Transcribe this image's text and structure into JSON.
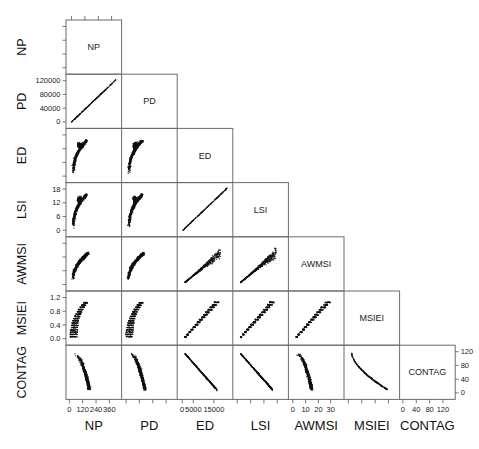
{
  "figure": {
    "type": "scatterplot-matrix",
    "variables": [
      "NP",
      "PD",
      "ED",
      "LSI",
      "AWMSI",
      "MSIEI",
      "CONTAG"
    ],
    "layout": "lower-triangular pairwise scatterplot matrix with variable names on the diagonal",
    "panel_count": 28,
    "background": "#ffffff",
    "point_color": "#111111",
    "frame_color": "#6b6b6b"
  },
  "row_labels": [
    "NP",
    "PD",
    "ED",
    "LSI",
    "AWMSI",
    "MSIEI",
    "CONTAG"
  ],
  "column_labels": [
    "NP",
    "PD",
    "ED",
    "LSI",
    "AWMSI",
    "MSIEI",
    "CONTAG"
  ],
  "diagonal_labels": [
    "NP",
    "PD",
    "ED",
    "LSI",
    "AWMSI",
    "MSIEI",
    "CONTAG"
  ],
  "axes": {
    "left": [
      {
        "var": "PD",
        "ticks": [
          "120000",
          "80000",
          "40000",
          "0"
        ],
        "values": [
          120000,
          80000,
          40000,
          0
        ]
      },
      {
        "var": "LSI",
        "ticks": [
          "18",
          "12",
          "6",
          "0"
        ],
        "values": [
          18,
          12,
          6,
          0
        ]
      },
      {
        "var": "MSIEI",
        "ticks": [
          "1.2",
          "0.8",
          "0.4",
          "0.0"
        ],
        "values": [
          1.2,
          0.8,
          0.4,
          0.0
        ]
      }
    ],
    "right": [
      {
        "var": "CONTAG",
        "ticks": [
          "120",
          "80",
          "40",
          "0"
        ],
        "values": [
          120,
          80,
          40,
          0
        ]
      }
    ],
    "bottom": [
      {
        "var": "NP",
        "ticks": [
          "0",
          "120",
          "240",
          "360"
        ],
        "values": [
          0,
          120,
          240,
          360
        ]
      },
      {
        "var": "ED",
        "ticks": [
          "0",
          "5000",
          "15000"
        ],
        "values": [
          0,
          5000,
          15000
        ]
      },
      {
        "var": "AWMSI",
        "ticks": [
          "0",
          "10",
          "20",
          "30"
        ],
        "values": [
          0,
          10,
          20,
          30
        ]
      },
      {
        "var": "CONTAG",
        "ticks": [
          "0",
          "40",
          "80",
          "120"
        ],
        "values": [
          0,
          40,
          80,
          120
        ]
      }
    ]
  },
  "chart_data": {
    "type": "scatter",
    "title": "",
    "xlabel": "",
    "ylabel": "",
    "variables": [
      "NP",
      "PD",
      "ED",
      "LSI",
      "AWMSI",
      "MSIEI",
      "CONTAG"
    ],
    "axis_ranges": {
      "NP": [
        0,
        400
      ],
      "PD": [
        0,
        130000
      ],
      "ED": [
        0,
        18000
      ],
      "LSI": [
        0,
        19
      ],
      "AWMSI": [
        0,
        33
      ],
      "MSIEI": [
        0,
        1.3
      ],
      "CONTAG": [
        0,
        125
      ]
    },
    "grid": false,
    "legend": "none",
    "panels": [
      {
        "row": "PD",
        "col": "NP",
        "shape": "tight positive linear band",
        "trend": "positive",
        "density": "very narrow"
      },
      {
        "row": "ED",
        "col": "NP",
        "shape": "crescent / comma, steep then saturating",
        "trend": "positive-saturating",
        "density": "thick"
      },
      {
        "row": "ED",
        "col": "PD",
        "shape": "crescent / comma, steep then saturating",
        "trend": "positive-saturating",
        "density": "thick"
      },
      {
        "row": "LSI",
        "col": "NP",
        "shape": "crescent / comma, steep then saturating",
        "trend": "positive-saturating",
        "density": "thick"
      },
      {
        "row": "LSI",
        "col": "PD",
        "shape": "crescent / comma, steep then saturating",
        "trend": "positive-saturating",
        "density": "thick"
      },
      {
        "row": "LSI",
        "col": "ED",
        "shape": "thin positive diagonal line",
        "trend": "positive-linear",
        "density": "very narrow"
      },
      {
        "row": "AWMSI",
        "col": "NP",
        "shape": "comma / hook rising then flattening",
        "trend": "positive-saturating",
        "density": "thick"
      },
      {
        "row": "AWMSI",
        "col": "PD",
        "shape": "comma / hook rising then flattening",
        "trend": "positive-saturating",
        "density": "thick"
      },
      {
        "row": "AWMSI",
        "col": "ED",
        "shape": "wedge widening to upper right",
        "trend": "positive",
        "density": "fan"
      },
      {
        "row": "AWMSI",
        "col": "LSI",
        "shape": "wedge widening to upper right",
        "trend": "positive",
        "density": "fan"
      },
      {
        "row": "MSIEI",
        "col": "NP",
        "shape": "banded crescent rising to plateau",
        "trend": "positive-saturating",
        "density": "striped"
      },
      {
        "row": "MSIEI",
        "col": "PD",
        "shape": "banded crescent rising to plateau",
        "trend": "positive-saturating",
        "density": "striped"
      },
      {
        "row": "MSIEI",
        "col": "ED",
        "shape": "banded upward wedge",
        "trend": "positive",
        "density": "striped"
      },
      {
        "row": "MSIEI",
        "col": "LSI",
        "shape": "banded upward wedge",
        "trend": "positive",
        "density": "striped"
      },
      {
        "row": "MSIEI",
        "col": "AWMSI",
        "shape": "banded upward wedge, steep",
        "trend": "positive",
        "density": "striped"
      },
      {
        "row": "CONTAG",
        "col": "NP",
        "shape": "descending curved band",
        "trend": "negative-curved",
        "density": "thick"
      },
      {
        "row": "CONTAG",
        "col": "PD",
        "shape": "descending curved band",
        "trend": "negative-curved",
        "density": "thick"
      },
      {
        "row": "CONTAG",
        "col": "ED",
        "shape": "descending near-linear band",
        "trend": "negative",
        "density": "narrow"
      },
      {
        "row": "CONTAG",
        "col": "LSI",
        "shape": "descending near-linear band",
        "trend": "negative",
        "density": "narrow"
      },
      {
        "row": "CONTAG",
        "col": "AWMSI",
        "shape": "descending curved band",
        "trend": "negative-curved",
        "density": "narrow"
      },
      {
        "row": "CONTAG",
        "col": "MSIEI",
        "shape": "descending convex curve",
        "trend": "negative-curved",
        "density": "narrow"
      }
    ]
  }
}
